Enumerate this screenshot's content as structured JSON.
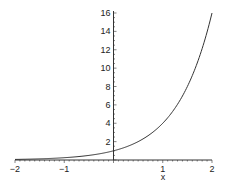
{
  "chart_data": {
    "type": "line",
    "title": "",
    "xlabel": "x",
    "ylabel": "",
    "xlim": [
      -2,
      2
    ],
    "ylim": [
      0,
      16
    ],
    "grid": false,
    "legend": null,
    "x_ticks": [
      "-2",
      "-1",
      "1",
      "2"
    ],
    "y_ticks": [
      "2",
      "4",
      "6",
      "8",
      "10",
      "12",
      "14",
      "16"
    ],
    "series": [
      {
        "name": "4^x",
        "color": "#333333",
        "x": [
          -2,
          -1.5,
          -1,
          -0.5,
          0,
          0.25,
          0.5,
          0.75,
          1,
          1.25,
          1.5,
          1.75,
          2
        ],
        "values": [
          0.0625,
          0.125,
          0.25,
          0.5,
          1,
          1.41,
          2,
          2.83,
          4,
          5.66,
          8,
          11.31,
          16
        ]
      }
    ]
  },
  "colors": {
    "axis": "#333333",
    "curve": "#333333",
    "background": "#ffffff"
  }
}
